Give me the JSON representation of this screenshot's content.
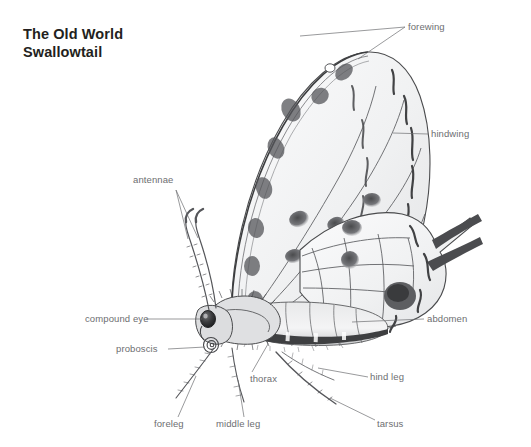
{
  "page": {
    "background_color": "#ffffff",
    "title": "The Old World\nSwallowtail",
    "title_color": "#231f20",
    "label_color": "#6d6e71"
  },
  "labels": {
    "forewing": "forewing",
    "hindwing": "hindwing",
    "antennae": "antennae",
    "compound_eye": "compound eye",
    "proboscis": "proboscis",
    "thorax": "thorax",
    "foreleg": "foreleg",
    "middle_leg": "middle leg",
    "abdomen": "abdomen",
    "hind_leg": "hind leg",
    "tarsus": "tarsus"
  },
  "illustration": {
    "name": "old-world-swallowtail-side-view",
    "style": "pencil-ink-drawing",
    "ink_color": "#3f3f41",
    "wash_color": "#d8d9db",
    "parts": [
      "forewing",
      "hindwing",
      "antennae",
      "compound eye",
      "proboscis",
      "thorax",
      "foreleg",
      "middle leg",
      "abdomen",
      "hind leg",
      "tarsus"
    ]
  }
}
